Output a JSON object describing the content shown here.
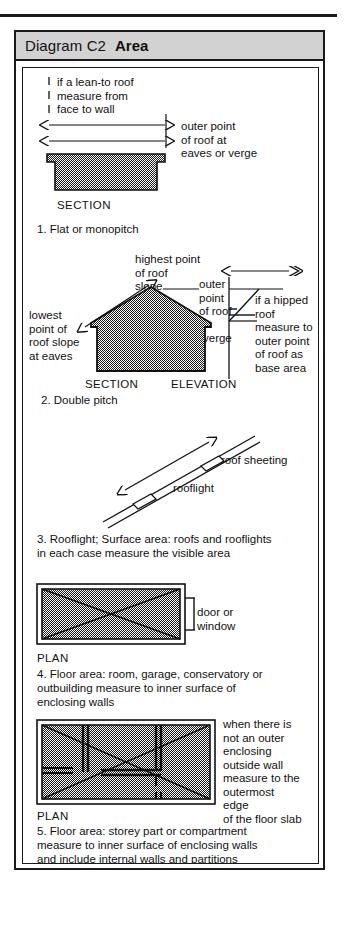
{
  "header": {
    "diagram_id": "Diagram C2",
    "title": "Area"
  },
  "colors": {
    "rule": "#1a1a1a",
    "header_bg": "#d2d2d2",
    "hatch_fill": "#8a8a8a",
    "ink": "#111111"
  },
  "sections": [
    {
      "number": "1",
      "caption": "1. Flat or monopitch",
      "view_label": "SECTION",
      "annotations": {
        "left_note": "if a lean-to roof\nmeasure from\nface to wall",
        "right_note": "outer point\nof roof at\neaves or verge"
      }
    },
    {
      "number": "2",
      "caption": "2. Double pitch",
      "view_label_left": "SECTION",
      "view_label_right": "ELEVATION",
      "annotations": {
        "highest": "highest point\nof roof\nslope",
        "lowest": "lowest\npoint of\nroof slope\nat eaves",
        "outer": "outer\npoint\nof roof",
        "verge": "verge",
        "hipped": "if a hipped\nroof\nmeasure to\nouter point\nof roof as\nbase area"
      }
    },
    {
      "number": "3",
      "caption": "3. Rooflight; Surface area: roofs and rooflights\nin each case measure the visible area",
      "annotations": {
        "roof_sheeting": "roof sheeting",
        "rooflight": "rooflight"
      }
    },
    {
      "number": "4",
      "caption": "4. Floor area: room, garage, conservatory or\noutbuilding measure to inner surface of\nenclosing walls",
      "view_label": "PLAN",
      "annotations": {
        "opening": "door or\nwindow"
      }
    },
    {
      "number": "5",
      "caption": "5. Floor area: storey part or compartment\nmeasure to inner surface of enclosing walls\nand include internal walls and partitions",
      "view_label": "PLAN",
      "annotations": {
        "outer_wall_note": "when there is\nnot an outer\nenclosing\noutside wall\nmeasure to the\noutermost\nedge\nof the floor slab"
      }
    }
  ]
}
